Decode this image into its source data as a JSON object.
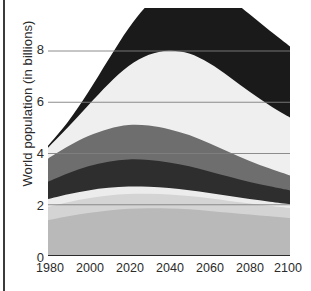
{
  "chart_data": {
    "type": "area",
    "stacked": true,
    "title": "",
    "xlabel": "",
    "ylabel": "World population (in billions)",
    "x": [
      1980,
      1990,
      2000,
      2010,
      2020,
      2030,
      2040,
      2050,
      2060,
      2070,
      2080,
      2090,
      2100
    ],
    "xlim": [
      1980,
      2100
    ],
    "ylim": [
      0,
      9.6
    ],
    "xticks": [
      1980,
      2000,
      2020,
      2040,
      2060,
      2080,
      2100
    ],
    "yticks": [
      0,
      2,
      4,
      6,
      8
    ],
    "ytick_labels": [
      "0",
      "2",
      "4",
      "6",
      "8"
    ],
    "xtick_labels": [
      "1980",
      "2000",
      "2020",
      "2040",
      "2060",
      "2080",
      "2100"
    ],
    "grid": "horizontal",
    "gridlines_at": [
      2,
      4,
      6,
      8
    ],
    "legend": "none",
    "series": [
      {
        "name": "band-1-light-gray",
        "color": "#b9b9b9",
        "values": [
          1.4,
          1.55,
          1.68,
          1.78,
          1.84,
          1.86,
          1.85,
          1.82,
          1.76,
          1.69,
          1.62,
          1.55,
          1.48
        ]
      },
      {
        "name": "band-2-pale-gray",
        "color": "#d4d4d4",
        "values": [
          0.52,
          0.55,
          0.57,
          0.58,
          0.58,
          0.57,
          0.55,
          0.52,
          0.49,
          0.46,
          0.43,
          0.41,
          0.39
        ]
      },
      {
        "name": "band-3-very-light",
        "color": "#ececec",
        "values": [
          0.3,
          0.31,
          0.31,
          0.3,
          0.29,
          0.27,
          0.25,
          0.23,
          0.21,
          0.19,
          0.17,
          0.16,
          0.15
        ]
      },
      {
        "name": "band-4-near-black",
        "color": "#2e2e2e",
        "values": [
          0.68,
          0.82,
          0.94,
          1.02,
          1.06,
          1.05,
          1.0,
          0.93,
          0.84,
          0.75,
          0.67,
          0.6,
          0.54
        ]
      },
      {
        "name": "band-5-mid-gray",
        "color": "#6e6e6e",
        "values": [
          0.9,
          1.05,
          1.18,
          1.28,
          1.34,
          1.34,
          1.3,
          1.22,
          1.1,
          0.96,
          0.82,
          0.69,
          0.58
        ]
      },
      {
        "name": "band-6-off-white",
        "color": "#efefef",
        "values": [
          0.42,
          0.75,
          1.2,
          1.75,
          2.3,
          2.76,
          3.06,
          3.18,
          3.12,
          2.94,
          2.7,
          2.46,
          2.26
        ]
      },
      {
        "name": "band-7-black",
        "color": "#1a1a1a",
        "values": [
          0.08,
          0.22,
          0.52,
          0.96,
          1.48,
          2.0,
          2.45,
          2.78,
          2.98,
          3.06,
          3.02,
          2.92,
          2.78
        ]
      }
    ],
    "totals": [
      4.3,
      5.25,
      6.4,
      7.67,
      8.89,
      9.85,
      10.46,
      10.68,
      10.5,
      10.05,
      9.43,
      8.79,
      8.18
    ],
    "colors": {
      "axis": "#2b2b2b",
      "gridline": "#808080",
      "background": "#ffffff",
      "border_rule": "#3b3b3b"
    }
  }
}
